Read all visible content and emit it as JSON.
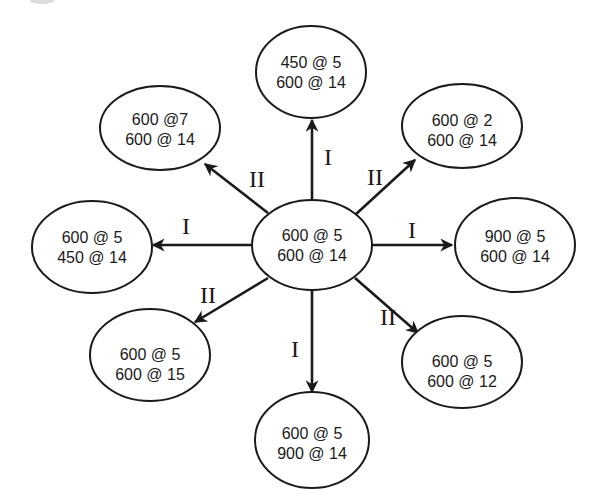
{
  "diagram": {
    "center": {
      "line1": "600 @ 5",
      "line2": "600 @ 14"
    },
    "nodes": {
      "top": {
        "line1": "450 @ 5",
        "line2": "600 @ 14",
        "edge_label": "I"
      },
      "top_right": {
        "line1": "600 @ 2",
        "line2": "600 @ 14",
        "edge_label": "II"
      },
      "right": {
        "line1": "900 @ 5",
        "line2": "600 @ 14",
        "edge_label": "I"
      },
      "bottom_right": {
        "line1": "600 @ 5",
        "line2": "600 @ 12",
        "edge_label": "II"
      },
      "bottom": {
        "line1": "600 @ 5",
        "line2": "900 @ 14",
        "edge_label": "I"
      },
      "bottom_left": {
        "line1": "600 @ 5",
        "line2": "600 @ 15",
        "edge_label": "II"
      },
      "left": {
        "line1": "600 @ 5",
        "line2": "450 @ 14",
        "edge_label": "I"
      },
      "top_left": {
        "line1": "600 @7",
        "line2": "600 @ 14",
        "edge_label": "II"
      }
    },
    "colors": {
      "stroke": "#1a1a1a",
      "background": "#ffffff"
    }
  }
}
